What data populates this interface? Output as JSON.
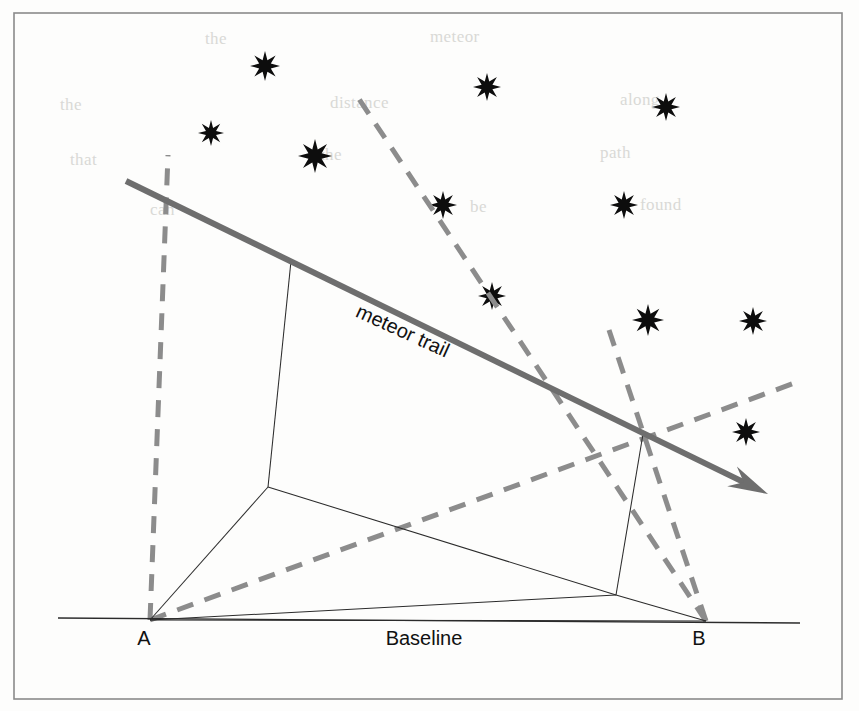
{
  "figure": {
    "width": 859,
    "height": 711,
    "background_color": "#fdfdfc",
    "frame": {
      "name": "figure-border",
      "x": 14,
      "y": 13,
      "width": 828,
      "height": 686,
      "stroke_color": "#8a8a8a"
    }
  },
  "labels": {
    "meteor_trail": "meteor trail",
    "station_a": "A",
    "station_b": "B",
    "baseline": "Baseline"
  },
  "label_positions": {
    "meteor_trail": {
      "x": 400,
      "y": 337,
      "rotation": 24.5
    },
    "station_a": {
      "x": 144,
      "y": 645
    },
    "station_b": {
      "x": 699,
      "y": 645
    },
    "baseline": {
      "x": 424,
      "y": 645
    }
  },
  "colors": {
    "trail": "#6e6e6e",
    "sight_lines": "#8c8c8c",
    "thin_lines": "#2b2b2b",
    "stars": "#0d0d0d",
    "frame": "#8a8a8a",
    "bleed_text": "#d9d9d6"
  },
  "points": {
    "station_a": {
      "x": 150,
      "y": 620
    },
    "station_b": {
      "x": 706,
      "y": 621
    },
    "node_near": {
      "x": 291,
      "y": 261
    },
    "node_far": {
      "x": 643,
      "y": 434
    },
    "foot_near": {
      "x": 268,
      "y": 487
    },
    "foot_far": {
      "x": 616,
      "y": 595
    },
    "trail_start": {
      "x": 126,
      "y": 181
    },
    "trail_end": {
      "x": 768,
      "y": 494
    }
  },
  "chart_data": {
    "type": "diagram",
    "meteor_trail": {
      "label": "meteor trail",
      "from": [
        126,
        181
      ],
      "to": [
        768,
        494
      ],
      "arrowhead": "end",
      "style": "solid-thick",
      "color": "#6e6e6e"
    },
    "baseline": {
      "label": "Baseline",
      "from": [
        58,
        618
      ],
      "to": [
        800,
        623
      ],
      "style": "thin-solid"
    },
    "stations": [
      {
        "label": "A",
        "x": 150,
        "y": 620
      },
      {
        "label": "B",
        "x": 706,
        "y": 621
      }
    ],
    "trail_nodes": [
      {
        "name": "node-near",
        "x": 291,
        "y": 261
      },
      {
        "name": "node-far",
        "x": 643,
        "y": 434
      }
    ],
    "foot_points": [
      {
        "name": "foot-near",
        "x": 268,
        "y": 487
      },
      {
        "name": "foot-far",
        "x": 616,
        "y": 595
      }
    ],
    "sight_lines": [
      {
        "name": "a-to-node-near",
        "from": [
          150,
          620
        ],
        "to": [
          168,
          155
        ],
        "style": "dashed"
      },
      {
        "name": "a-to-node-far",
        "from": [
          150,
          620
        ],
        "to": [
          800,
          381
        ],
        "style": "dashed"
      },
      {
        "name": "b-to-node-near",
        "from": [
          706,
          621
        ],
        "to": [
          355,
          93
        ],
        "style": "dashed"
      },
      {
        "name": "b-to-node-far",
        "from": [
          706,
          621
        ],
        "to": [
          609,
          330
        ],
        "style": "dashed"
      }
    ],
    "thin_construction_lines": [
      {
        "name": "node-near-to-foot-near",
        "from": [
          291,
          261
        ],
        "to": [
          268,
          487
        ]
      },
      {
        "name": "node-far-to-foot-far",
        "from": [
          643,
          434
        ],
        "to": [
          616,
          595
        ]
      },
      {
        "name": "foot-near-to-a",
        "from": [
          268,
          487
        ],
        "to": [
          150,
          620
        ]
      },
      {
        "name": "foot-near-to-foot-far",
        "from": [
          268,
          487
        ],
        "to": [
          616,
          595
        ]
      },
      {
        "name": "foot-far-to-b",
        "from": [
          616,
          595
        ],
        "to": [
          706,
          621
        ]
      },
      {
        "name": "a-to-foot-far",
        "from": [
          150,
          620
        ],
        "to": [
          616,
          595
        ]
      },
      {
        "name": "a-to-b",
        "from": [
          150,
          620
        ],
        "to": [
          706,
          621
        ]
      }
    ],
    "stars": [
      {
        "x": 265,
        "y": 66,
        "size": 15
      },
      {
        "x": 211,
        "y": 133,
        "size": 13
      },
      {
        "x": 315,
        "y": 156,
        "size": 17
      },
      {
        "x": 487,
        "y": 87,
        "size": 14
      },
      {
        "x": 666,
        "y": 107,
        "size": 14
      },
      {
        "x": 443,
        "y": 205,
        "size": 14
      },
      {
        "x": 624,
        "y": 205,
        "size": 14
      },
      {
        "x": 492,
        "y": 296,
        "size": 14
      },
      {
        "x": 648,
        "y": 320,
        "size": 16
      },
      {
        "x": 753,
        "y": 321,
        "size": 14
      },
      {
        "x": 746,
        "y": 432,
        "size": 14
      }
    ]
  },
  "bleed_through_text": {
    "note": "faint reverse-side print visible through the paper",
    "lines": [
      {
        "x": 205,
        "y": 44,
        "text": "the"
      },
      {
        "x": 430,
        "y": 42,
        "text": "meteor"
      },
      {
        "x": 60,
        "y": 110,
        "text": "the"
      },
      {
        "x": 330,
        "y": 108,
        "text": "distance"
      },
      {
        "x": 620,
        "y": 105,
        "text": "along"
      },
      {
        "x": 70,
        "y": 165,
        "text": "that"
      },
      {
        "x": 320,
        "y": 160,
        "text": "the"
      },
      {
        "x": 600,
        "y": 158,
        "text": "path"
      },
      {
        "x": 150,
        "y": 215,
        "text": "can"
      },
      {
        "x": 470,
        "y": 212,
        "text": "be"
      },
      {
        "x": 640,
        "y": 210,
        "text": "found"
      }
    ]
  }
}
